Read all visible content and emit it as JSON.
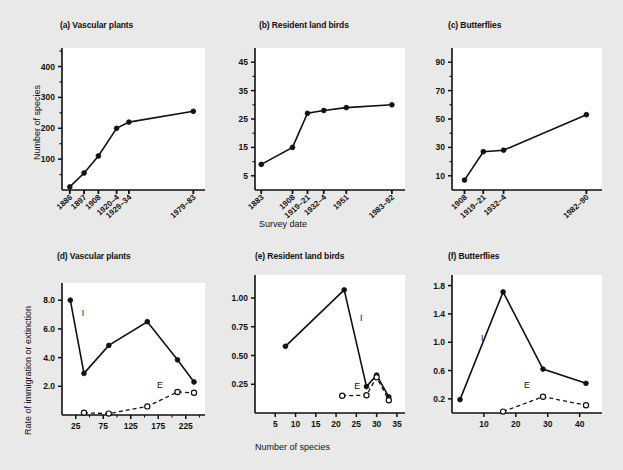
{
  "figure": {
    "background": "#e9e9e9",
    "plot_background": "#ffffff",
    "ink": "#111111",
    "shared_xlabel_top": "Survey date",
    "shared_xlabel_bottom": "Number of species",
    "shared_ylabel_top": "Number of species",
    "shared_ylabel_bottom": "Rate of immigration or extinction"
  },
  "chart_data": [
    {
      "id": "a",
      "type": "line",
      "title": "(a) Vascular plants",
      "xlabel": "Survey date",
      "ylabel": "Number of species",
      "x_tick_labels": [
        "1886",
        "1897",
        "1908",
        "1920–4",
        "1929–34",
        "1979–83"
      ],
      "x_tick_positions": [
        1886,
        1897,
        1908,
        1922,
        1931.5,
        1981
      ],
      "xlim": [
        1880,
        1990
      ],
      "ylim": [
        0,
        460
      ],
      "y_ticks": [
        100,
        200,
        300,
        400
      ],
      "y_minor_ticks": [
        50,
        150,
        250,
        350,
        450
      ],
      "grid": false,
      "legend": "none",
      "series": [
        {
          "name": "Number of species",
          "marker": "filled-circle",
          "line": "solid",
          "x": [
            1886,
            1897,
            1908,
            1922,
            1931.5,
            1981
          ],
          "values": [
            10,
            55,
            110,
            200,
            220,
            255
          ]
        }
      ]
    },
    {
      "id": "b",
      "type": "line",
      "title": "(b) Resident land birds",
      "xlabel": "Survey date",
      "ylabel": "Number of species",
      "x_tick_labels": [
        "1883",
        "1908",
        "1919–21",
        "1932–4",
        "1951",
        "1983–92"
      ],
      "x_tick_positions": [
        1883,
        1908,
        1920,
        1933,
        1951,
        1987.5
      ],
      "xlim": [
        1878,
        1998
      ],
      "ylim": [
        0,
        50
      ],
      "y_ticks": [
        5,
        15,
        25,
        35,
        45
      ],
      "y_minor_ticks": [
        10,
        20,
        30,
        40
      ],
      "grid": false,
      "legend": "none",
      "series": [
        {
          "name": "Number of species",
          "marker": "filled-circle",
          "line": "solid",
          "x": [
            1883,
            1908,
            1920,
            1933,
            1951,
            1987.5
          ],
          "values": [
            9,
            15,
            27,
            28,
            29,
            30
          ]
        }
      ]
    },
    {
      "id": "c",
      "type": "line",
      "title": "(c) Butterflies",
      "xlabel": "Survey date",
      "ylabel": "Number of species",
      "x_tick_labels": [
        "1908",
        "1919–21",
        "1932–4",
        "1982–90"
      ],
      "x_tick_positions": [
        1908,
        1920,
        1933,
        1986
      ],
      "xlim": [
        1900,
        1996
      ],
      "ylim": [
        0,
        100
      ],
      "y_ticks": [
        10,
        30,
        50,
        70,
        90
      ],
      "y_minor_ticks": [
        20,
        40,
        60,
        80
      ],
      "grid": false,
      "legend": "none",
      "series": [
        {
          "name": "Number of species",
          "marker": "filled-circle",
          "line": "solid",
          "x": [
            1908,
            1920,
            1933,
            1986
          ],
          "values": [
            7,
            27,
            28,
            53
          ]
        }
      ]
    },
    {
      "id": "d",
      "type": "line",
      "title": "(d) Vascular plants",
      "xlabel": "Number of species",
      "ylabel": "Rate of immigration or extinction",
      "x_ticks": [
        25,
        75,
        125,
        175,
        225
      ],
      "x_minor_ticks": [
        50,
        100,
        150,
        200,
        250
      ],
      "xlim": [
        0,
        260
      ],
      "ylim": [
        0,
        9.2
      ],
      "y_ticks": [
        2.0,
        4.0,
        6.0,
        8.0
      ],
      "y_tick_labels": [
        "2.0",
        "4.0",
        "6.0",
        "8.0"
      ],
      "grid": false,
      "legend": "inline-annotations",
      "annotations": [
        {
          "text": "I",
          "x": 38,
          "y": 6.9
        },
        {
          "text": "E",
          "x": 178,
          "y": 1.85
        }
      ],
      "series": [
        {
          "name": "I",
          "label": "Immigration",
          "marker": "filled-circle",
          "line": "solid",
          "x": [
            15,
            40,
            85,
            155,
            210,
            240
          ],
          "values": [
            8.0,
            2.9,
            4.85,
            6.5,
            3.85,
            2.3
          ]
        },
        {
          "name": "E",
          "label": "Extinction",
          "marker": "open-circle",
          "line": "dashed",
          "x": [
            40,
            85,
            155,
            210,
            240
          ],
          "values": [
            0.15,
            0.1,
            0.6,
            1.6,
            1.55
          ]
        }
      ]
    },
    {
      "id": "e",
      "type": "line",
      "title": "(e) Resident land birds",
      "xlabel": "Number of species",
      "ylabel": "Rate of immigration or extinction",
      "x_ticks": [
        5,
        10,
        15,
        20,
        25,
        30,
        35
      ],
      "xlim": [
        0,
        37
      ],
      "ylim": [
        0,
        1.2
      ],
      "y_ticks": [
        0.25,
        0.5,
        0.75,
        1.0
      ],
      "y_tick_labels": [
        "0.25",
        "0.50",
        "0.75",
        "1.00"
      ],
      "grid": false,
      "legend": "inline-annotations",
      "annotations": [
        {
          "text": "I",
          "x": 26.2,
          "y": 0.8
        },
        {
          "text": "E",
          "x": 25.2,
          "y": 0.21
        }
      ],
      "series": [
        {
          "name": "I",
          "label": "Immigration",
          "marker": "filled-circle",
          "line": "solid",
          "x": [
            7.5,
            22,
            27.5,
            30,
            33
          ],
          "values": [
            0.58,
            1.07,
            0.23,
            0.33,
            0.14
          ]
        },
        {
          "name": "E",
          "label": "Extinction",
          "marker": "open-circle",
          "line": "dashed",
          "x": [
            21.5,
            27.5,
            30,
            33
          ],
          "values": [
            0.15,
            0.155,
            0.31,
            0.11
          ]
        }
      ]
    },
    {
      "id": "f",
      "type": "line",
      "title": "(f) Butterflies",
      "xlabel": "Number of species",
      "ylabel": "Rate of immigration or extinction",
      "x_ticks": [
        10,
        20,
        30,
        40
      ],
      "xlim": [
        0,
        47
      ],
      "ylim": [
        0,
        1.95
      ],
      "y_ticks": [
        0.2,
        0.6,
        1.0,
        1.4,
        1.8
      ],
      "y_tick_labels": [
        "0.2",
        "0.6",
        "1.0",
        "1.4",
        "1.8"
      ],
      "grid": false,
      "legend": "inline-annotations",
      "annotations": [
        {
          "text": "I",
          "x": 9.5,
          "y": 1.02
        },
        {
          "text": "E",
          "x": 23.5,
          "y": 0.35
        }
      ],
      "series": [
        {
          "name": "I",
          "label": "Immigration",
          "marker": "filled-circle",
          "line": "solid",
          "x": [
            2.5,
            16,
            28.5,
            42
          ],
          "values": [
            0.19,
            1.71,
            0.62,
            0.42
          ]
        },
        {
          "name": "E",
          "label": "Extinction",
          "marker": "open-circle",
          "line": "dashed",
          "x": [
            16,
            28.5,
            42
          ],
          "values": [
            0.02,
            0.23,
            0.11
          ]
        }
      ]
    }
  ]
}
